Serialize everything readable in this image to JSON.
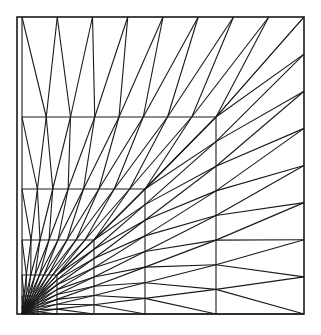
{
  "figure": {
    "type": "mesh-diagram",
    "background_color": "#ffffff",
    "line_color": "#1a1a1a",
    "canvas": {
      "width": 321,
      "height": 335
    }
  },
  "mesh_data": {
    "type": "diagram",
    "domain": {
      "x0": 17,
      "y0": 17,
      "x1": 304,
      "y1": 314
    },
    "refinement_corner": {
      "x": 22,
      "y": 314,
      "label": "lower-left"
    },
    "grading_factor": 0.5,
    "layer_corners": [
      {
        "level": 0,
        "x": 304,
        "y": 17
      },
      {
        "level": 1,
        "x": 216,
        "y": 117
      },
      {
        "level": 2,
        "x": 145,
        "y": 189
      },
      {
        "level": 3,
        "x": 94,
        "y": 240
      },
      {
        "level": 4,
        "x": 57,
        "y": 275
      },
      {
        "level": 5,
        "x": 38,
        "y": 296
      },
      {
        "level": 6,
        "x": 29,
        "y": 306
      },
      {
        "level": 7,
        "x": 25,
        "y": 311
      }
    ],
    "vertical_grid_x": [
      17,
      25,
      29,
      38,
      57,
      94,
      145,
      216,
      304
    ],
    "horizontal_grid_y": [
      314,
      311,
      306,
      296,
      275,
      240,
      189,
      117,
      17
    ],
    "cells_per_band": 8,
    "diagonal_direction": "lower-left to upper-right",
    "frame_stroke_width": 1.6,
    "edge_stroke_width": 1.1,
    "total_layers": 8
  }
}
